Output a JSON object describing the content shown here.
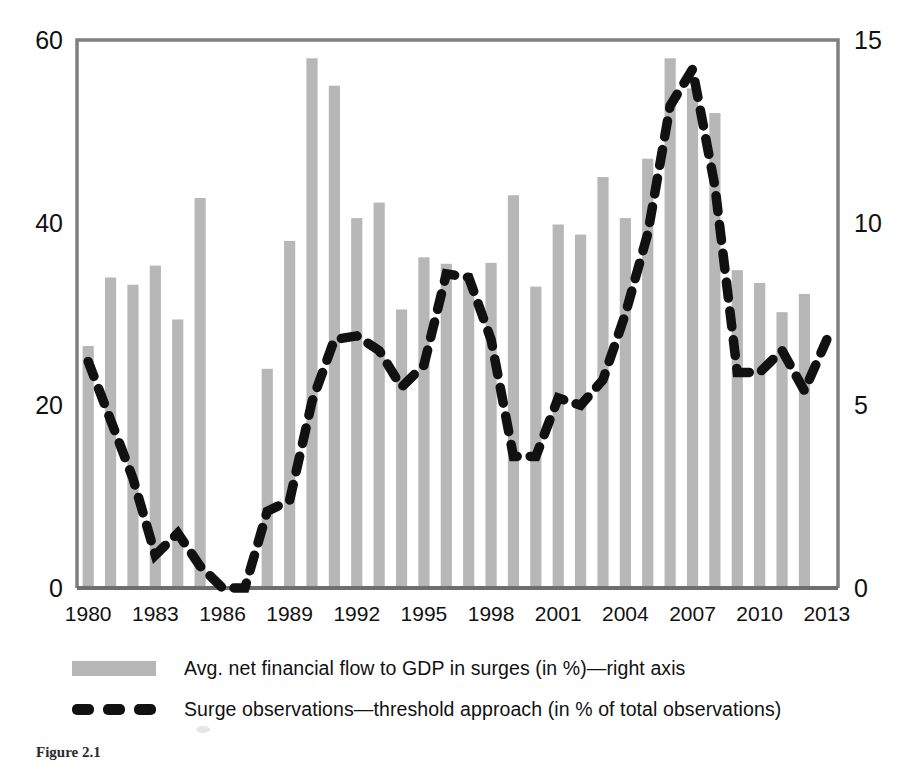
{
  "figure": {
    "caption": "Figure 2.1"
  },
  "legend": {
    "position": "below-plot",
    "items": [
      {
        "marker": "bar-swatch",
        "label": "Avg. net financial flow to GDP in surges (in %)—right axis"
      },
      {
        "marker": "dashed-line-swatch",
        "label": "Surge observations—threshold approach (in % of total observations)"
      }
    ]
  },
  "colors": {
    "bar": "#b7b7b7",
    "line": "#111111",
    "axis": "#808080",
    "text": "#111111",
    "background": "#ffffff"
  },
  "chart_data": {
    "type": "bar",
    "title": "",
    "subtitle": "",
    "xlabel": "",
    "ylabel": "",
    "grid": false,
    "legend_position": "bottom",
    "x": [
      1980,
      1981,
      1982,
      1983,
      1984,
      1985,
      1986,
      1987,
      1988,
      1989,
      1990,
      1991,
      1992,
      1993,
      1994,
      1995,
      1996,
      1997,
      1998,
      1999,
      2000,
      2001,
      2002,
      2003,
      2004,
      2005,
      2006,
      2007,
      2008,
      2009,
      2010,
      2011,
      2012,
      2013
    ],
    "categories": [
      "1980",
      "1981",
      "1982",
      "1983",
      "1984",
      "1985",
      "1986",
      "1987",
      "1988",
      "1989",
      "1990",
      "1991",
      "1992",
      "1993",
      "1994",
      "1995",
      "1996",
      "1997",
      "1998",
      "1999",
      "2000",
      "2001",
      "2002",
      "2003",
      "2004",
      "2005",
      "2006",
      "2007",
      "2008",
      "2009",
      "2010",
      "2011",
      "2012",
      "2013"
    ],
    "xtick_labels": [
      "1980",
      "1983",
      "1986",
      "1989",
      "1992",
      "1995",
      "1998",
      "2001",
      "2004",
      "2007",
      "2010",
      "2013"
    ],
    "xtick_values": [
      1980,
      1983,
      1986,
      1989,
      1992,
      1995,
      1998,
      2001,
      2004,
      2007,
      2010,
      2013
    ],
    "left_axis": {
      "name": "Avg. net financial flow to GDP in surges (in %)",
      "ticks": [
        0,
        20,
        40,
        60
      ],
      "tick_labels": [
        "0",
        "20",
        "40",
        "60"
      ],
      "ylim": [
        0,
        60
      ]
    },
    "right_axis": {
      "name": "Surge observations—threshold approach (in % of total observations)",
      "ticks": [
        0,
        5,
        10,
        15
      ],
      "tick_labels": [
        "0",
        "5",
        "10",
        "15"
      ],
      "ylim": [
        0,
        15
      ]
    },
    "series": [
      {
        "name": "Avg. net financial flow to GDP in surges (in %)—right axis",
        "type": "bar",
        "axis": "left",
        "color": "#b7b7b7",
        "values": [
          26.5,
          34.0,
          33.2,
          35.3,
          29.4,
          42.7,
          0,
          0,
          24.0,
          38.0,
          58.0,
          55.0,
          40.5,
          42.2,
          30.5,
          36.2,
          35.5,
          33.8,
          35.6,
          43.0,
          33.0,
          39.8,
          38.7,
          45.0,
          40.5,
          47.0,
          58.0,
          54.7,
          52.0,
          34.8,
          33.4,
          30.2,
          32.2,
          0
        ]
      },
      {
        "name": "Surge observations—threshold approach (in % of total observations)",
        "type": "line",
        "axis": "right",
        "color": "#111111",
        "style": "dashed",
        "values": [
          6.2,
          4.6,
          3.0,
          0.9,
          1.5,
          0.6,
          0.0,
          0.0,
          2.1,
          2.4,
          5.1,
          6.8,
          6.9,
          6.5,
          5.5,
          6.1,
          8.6,
          8.5,
          6.8,
          3.6,
          3.6,
          5.2,
          5.0,
          5.7,
          7.5,
          9.7,
          13.2,
          14.2,
          11.0,
          5.9,
          5.9,
          6.5,
          5.4,
          6.8
        ]
      }
    ]
  }
}
